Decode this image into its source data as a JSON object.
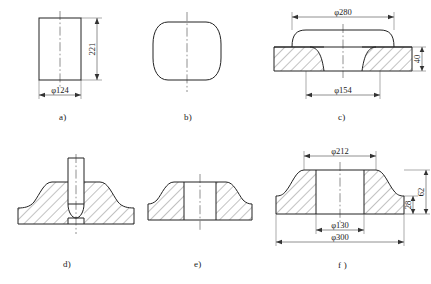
{
  "drawing": {
    "title": "Forging process stage drawings",
    "line_color": "#222222",
    "dim_color": "#333333",
    "background": "#ffffff"
  },
  "figures": [
    {
      "id": "a",
      "caption": "a)",
      "shape": "cylindrical-billet",
      "dimensions": [
        {
          "name": "diameter",
          "label": "φ124",
          "value": 124,
          "placement": "bottom"
        },
        {
          "name": "height",
          "label": "221",
          "value": 221,
          "placement": "right-vertical"
        }
      ]
    },
    {
      "id": "b",
      "caption": "b)",
      "shape": "upset-barrel",
      "dimensions": []
    },
    {
      "id": "c",
      "caption": "c)",
      "shape": "sectioned-disc-preform",
      "dimensions": [
        {
          "name": "outer-boss-diameter",
          "label": "φ280",
          "value": 280,
          "placement": "top"
        },
        {
          "name": "inner-diameter",
          "label": "φ154",
          "value": 154,
          "placement": "bottom"
        },
        {
          "name": "flange-thickness",
          "label": "40",
          "value": 40,
          "placement": "right-vertical"
        }
      ]
    },
    {
      "id": "d",
      "caption": "d)",
      "shape": "sectioned-hub-with-punch",
      "dimensions": []
    },
    {
      "id": "e",
      "caption": "e)",
      "shape": "sectioned-hub-pierced",
      "dimensions": []
    },
    {
      "id": "f",
      "caption": "f )",
      "shape": "finished-sectioned-hub",
      "dimensions": [
        {
          "name": "hub-outer-diameter",
          "label": "φ212",
          "value": 212,
          "placement": "top"
        },
        {
          "name": "bore-diameter",
          "label": "φ130",
          "value": 130,
          "placement": "bottom-inner"
        },
        {
          "name": "flange-outer-diameter",
          "label": "φ300",
          "value": 300,
          "placement": "bottom-outer"
        },
        {
          "name": "total-height",
          "label": "62",
          "value": 62,
          "placement": "right-vertical-outer"
        },
        {
          "name": "flange-thickness",
          "label": "28",
          "value": 28,
          "placement": "right-vertical-inner"
        }
      ]
    }
  ],
  "symbols": {
    "diameter_sign": "φ"
  }
}
